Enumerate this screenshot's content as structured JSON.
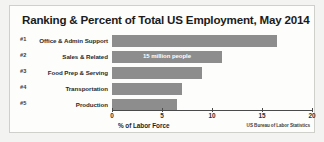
{
  "chart_data": {
    "type": "bar",
    "orientation": "horizontal",
    "title": "Ranking & Percent of Total US Employment, May 2014",
    "xlabel": "% of Labor Force",
    "ylabel": "",
    "xlim": [
      0,
      20
    ],
    "xticks": [
      0,
      5,
      10,
      15,
      20
    ],
    "xtick_labels": [
      "0",
      "5",
      "10",
      "15",
      "20"
    ],
    "grid": false,
    "legend": false,
    "source": "US Bureau of Labor Statistics",
    "categories": [
      "Office & Admin Support",
      "Sales & Related",
      "Food Prep & Serving",
      "Transportation",
      "Production"
    ],
    "ranks": [
      "#1",
      "#2",
      "#3",
      "#4",
      "#5"
    ],
    "values": [
      16.5,
      11.0,
      9.0,
      7.0,
      6.5
    ],
    "bar_color": "#8d8d8d",
    "annotations": [
      {
        "series_index": 1,
        "text": "15 million people",
        "color": "#ffffff"
      }
    ]
  },
  "rows": [
    {
      "rank": "#1",
      "label": "Office & Admin Support",
      "value": 16.5,
      "annotation": ""
    },
    {
      "rank": "#2",
      "label": "Sales & Related",
      "value": 11.0,
      "annotation": "15 million people"
    },
    {
      "rank": "#3",
      "label": "Food Prep & Serving",
      "value": 9.0,
      "annotation": ""
    },
    {
      "rank": "#4",
      "label": "Transportation",
      "value": 7.0,
      "annotation": ""
    },
    {
      "rank": "#5",
      "label": "Production",
      "value": 6.5,
      "annotation": ""
    }
  ],
  "axis": {
    "title": "% of Labor Force",
    "ticks": [
      "0",
      "5",
      "10",
      "15",
      "20"
    ]
  },
  "footer": {
    "source": "US Bureau of Labor Statistics"
  },
  "colors": {
    "bar": "#8d8d8d",
    "annotation_text": "#ffffff",
    "axis": "#4a4a4a",
    "card_background": "#fdfdfc",
    "page_background": "#f3f3f1"
  }
}
